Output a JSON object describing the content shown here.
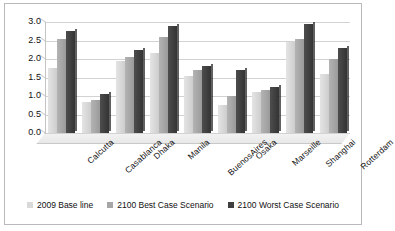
{
  "chart_data": {
    "type": "bar",
    "title": "",
    "xlabel": "",
    "ylabel": "",
    "ylim": [
      0,
      3.0
    ],
    "ytick_step": 0.5,
    "grid": true,
    "legend_position": "bottom",
    "yticks": [
      "3.0",
      "2.5",
      "2.0",
      "1.5",
      "1.0",
      "0.5",
      "0.0"
    ],
    "categories": [
      "Calcutta",
      "Casablanca",
      "Dhaka",
      "Manila",
      "BuenosAires",
      "Osaka",
      "Marseille",
      "Shanghai",
      "Rotterdam"
    ],
    "series": [
      {
        "name": "2009 Base line",
        "color": "#d9d9d9",
        "values": [
          1.75,
          0.85,
          1.95,
          2.15,
          1.55,
          0.75,
          1.1,
          2.45,
          1.6
        ]
      },
      {
        "name": "2100 Best Case Scenario",
        "color": "#a6a6a6",
        "values": [
          2.55,
          0.9,
          2.05,
          2.6,
          1.7,
          1.0,
          1.15,
          2.55,
          2.0
        ]
      },
      {
        "name": "2100 Worst Case Scenario",
        "color": "#3f3f3f",
        "values": [
          2.75,
          1.05,
          2.25,
          2.9,
          1.8,
          1.7,
          1.25,
          2.95,
          2.3
        ]
      }
    ]
  }
}
